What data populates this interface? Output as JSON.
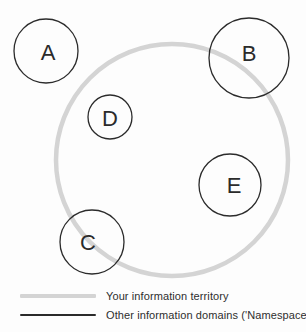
{
  "canvas": {
    "background": "#fdfdfd"
  },
  "diagram": {
    "territory": {
      "label": "Your information territory",
      "cx": 172,
      "cy": 160,
      "r": 116,
      "stroke_color": "#d4d4d4",
      "stroke_width": 4.5
    },
    "namespaces": {
      "legend_label": "Other information domains ('Namespaces')",
      "stroke_color": "#2b2b2b",
      "stroke_width": 1.3,
      "label_color": "#2b2b2b",
      "label_font_size": 22,
      "circles": [
        {
          "label": "A",
          "cx": 46,
          "cy": 51,
          "r": 32,
          "label_x": 48,
          "label_y": 52
        },
        {
          "label": "B",
          "cx": 249,
          "cy": 58,
          "r": 40,
          "label_x": 249,
          "label_y": 53
        },
        {
          "label": "D",
          "cx": 110,
          "cy": 117,
          "r": 22,
          "label_x": 110,
          "label_y": 118
        },
        {
          "label": "E",
          "cx": 230,
          "cy": 185,
          "r": 31,
          "label_x": 234,
          "label_y": 185
        },
        {
          "label": "C",
          "cx": 92,
          "cy": 242,
          "r": 32,
          "label_x": 88,
          "label_y": 242
        }
      ]
    }
  },
  "legend": {
    "items": [
      {
        "swatch": "thick-gray-line",
        "color": "#d4d4d4",
        "thickness": 4,
        "label": "Your information territory"
      },
      {
        "swatch": "thin-black-line",
        "color": "#2b2b2b",
        "thickness": 1.5,
        "label": "Other information domains ('Namespaces')"
      }
    ]
  }
}
